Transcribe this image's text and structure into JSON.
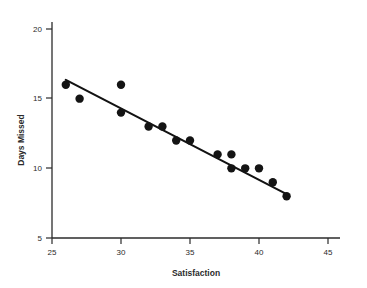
{
  "chart_data": {
    "type": "scatter",
    "title": "",
    "xlabel": "Satisfaction",
    "ylabel": "Days Missed",
    "xlim": [
      25,
      46
    ],
    "ylim": [
      5,
      20.5
    ],
    "xticks": [
      25,
      30,
      35,
      40,
      45
    ],
    "yticks": [
      5,
      10,
      15,
      20
    ],
    "xtick_labels": [
      "25",
      "30",
      "35",
      "40",
      "45"
    ],
    "ytick_labels": [
      "5",
      "10",
      "15",
      "20"
    ],
    "grid": false,
    "legend": null,
    "points": [
      {
        "x": 26,
        "y": 16
      },
      {
        "x": 27,
        "y": 15
      },
      {
        "x": 30,
        "y": 16
      },
      {
        "x": 30,
        "y": 14
      },
      {
        "x": 32,
        "y": 13
      },
      {
        "x": 33,
        "y": 13
      },
      {
        "x": 34,
        "y": 12
      },
      {
        "x": 35,
        "y": 12
      },
      {
        "x": 37,
        "y": 11
      },
      {
        "x": 38,
        "y": 11
      },
      {
        "x": 38,
        "y": 10
      },
      {
        "x": 39,
        "y": 10
      },
      {
        "x": 40,
        "y": 10
      },
      {
        "x": 41,
        "y": 9
      },
      {
        "x": 42,
        "y": 8
      }
    ],
    "trendline": {
      "type": "linear-fit",
      "x_start": 26,
      "y_start": 16.35,
      "x_end": 42,
      "y_end": 8.15
    },
    "marker": {
      "shape": "circle",
      "color": "#141414",
      "size_px": 4.2
    },
    "line_color": "#121212"
  }
}
